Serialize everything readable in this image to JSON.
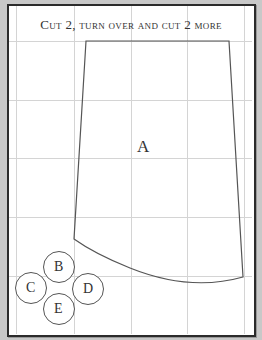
{
  "title": "Cut 2, turn over and cut 2 more",
  "pieces": {
    "main": "A",
    "circles": [
      {
        "label": "B",
        "cx": 59,
        "cy": 267
      },
      {
        "label": "C",
        "cx": 31,
        "cy": 288
      },
      {
        "label": "D",
        "cx": 88,
        "cy": 289
      },
      {
        "label": "E",
        "cx": 59,
        "cy": 309
      }
    ]
  },
  "colors": {
    "grid": "#d0d0d0",
    "outline": "#555555",
    "frame": "#2b2b2b",
    "background": "#c8c8c8"
  }
}
